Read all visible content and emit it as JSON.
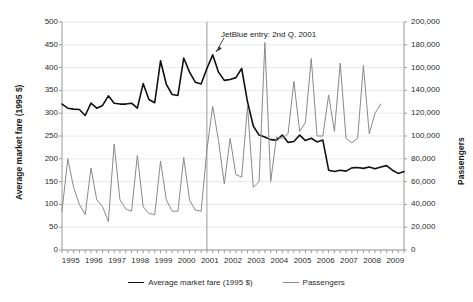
{
  "chart_data": {
    "type": "line",
    "title": "",
    "xlabel": "",
    "ylabel": "Average market fare (1995 $)",
    "y2label": "Passengers",
    "ylim": [
      0,
      500
    ],
    "y2lim": [
      0,
      200000
    ],
    "grid": true,
    "legend_position": "bottom",
    "x_tick_labels": [
      "1995",
      "1996",
      "1997",
      "1998",
      "1999",
      "2000",
      "2001",
      "2002",
      "2003",
      "2004",
      "2005",
      "2006",
      "2007",
      "2008",
      "2009"
    ],
    "y_tick_labels": [
      "0",
      "50",
      "100",
      "150",
      "200",
      "250",
      "300",
      "350",
      "400",
      "450",
      "500"
    ],
    "y2_tick_labels": [
      "0",
      "20,000",
      "40,000",
      "60,000",
      "80,000",
      "100,000",
      "120,000",
      "140,000",
      "160,000",
      "180,000",
      "200,000"
    ],
    "x_quarters": [
      "1995Q1",
      "1995Q2",
      "1995Q3",
      "1995Q4",
      "1996Q1",
      "1996Q2",
      "1996Q3",
      "1996Q4",
      "1997Q1",
      "1997Q2",
      "1997Q3",
      "1997Q4",
      "1998Q1",
      "1998Q2",
      "1998Q3",
      "1998Q4",
      "1999Q1",
      "1999Q2",
      "1999Q3",
      "1999Q4",
      "2000Q1",
      "2000Q2",
      "2000Q3",
      "2000Q4",
      "2001Q1",
      "2001Q2",
      "2001Q3",
      "2001Q4",
      "2002Q1",
      "2002Q2",
      "2002Q3",
      "2002Q4",
      "2003Q1",
      "2003Q2",
      "2003Q3",
      "2003Q4",
      "2004Q1",
      "2004Q2",
      "2004Q3",
      "2004Q4",
      "2005Q1",
      "2005Q2",
      "2005Q3",
      "2005Q4",
      "2006Q1",
      "2006Q2",
      "2006Q3",
      "2006Q4",
      "2007Q1",
      "2007Q2",
      "2007Q3",
      "2007Q4",
      "2008Q1",
      "2008Q2",
      "2008Q3",
      "2008Q4",
      "2009Q1",
      "2009Q2",
      "2009Q3",
      "2009Q4"
    ],
    "annotations": [
      {
        "text": "JetBlue entry: 2nd Q, 2001",
        "x_quarter": "2001Q2",
        "type": "vertical-line-with-arrow"
      }
    ],
    "series": [
      {
        "name": "Average market fare (1995 $)",
        "axis": "left",
        "color": "#111111",
        "values": [
          320,
          311,
          309,
          308,
          295,
          322,
          311,
          317,
          338,
          322,
          320,
          320,
          322,
          311,
          365,
          330,
          323,
          415,
          363,
          341,
          339,
          421,
          390,
          368,
          364,
          398,
          428,
          390,
          372,
          374,
          378,
          398,
          325,
          272,
          252,
          248,
          242,
          241,
          252,
          236,
          238,
          252,
          240,
          245,
          237,
          241,
          175,
          172,
          175,
          173,
          180,
          181,
          179,
          182,
          178,
          182,
          185,
          175,
          168,
          172
        ]
      },
      {
        "name": "Passengers",
        "axis": "right",
        "color": "#8a8a8a",
        "values": [
          34000,
          80000,
          55000,
          40000,
          31000,
          72000,
          44000,
          38000,
          25000,
          93000,
          44000,
          36000,
          34000,
          83000,
          38000,
          32000,
          31000,
          78000,
          44000,
          34000,
          34000,
          81000,
          44000,
          35000,
          34000,
          88000,
          126000,
          96000,
          58000,
          98000,
          66000,
          64000,
          126000,
          55000,
          60000,
          182000,
          60000,
          99000,
          98000,
          102000,
          148000,
          104000,
          112000,
          168000,
          100000,
          100000,
          136000,
          104000,
          164000,
          98000,
          94000,
          98000,
          162000,
          102000,
          120000,
          128000
        ]
      }
    ]
  },
  "legend": {
    "items": [
      {
        "label": "Average market fare (1995 $)",
        "color": "#111111"
      },
      {
        "label": "Passengers",
        "color": "#8a8a8a"
      }
    ]
  },
  "colors": {
    "fare_line": "#111111",
    "passenger_line": "#8a8a8a",
    "gridline": "#e8e8ef",
    "axis": "#9a9a9a",
    "text": "#2b2b2b",
    "background": "#ffffff"
  }
}
